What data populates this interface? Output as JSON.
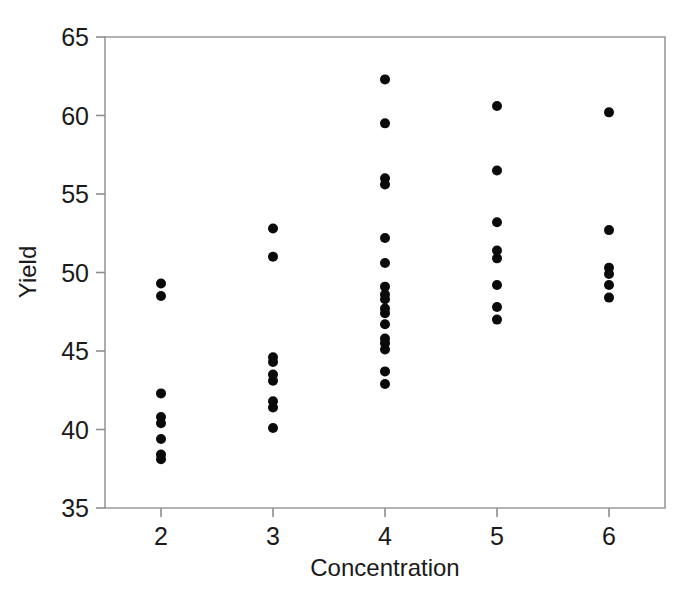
{
  "chart_data": {
    "type": "scatter",
    "title": "",
    "subtitle": "",
    "xlabel": "Concentration",
    "ylabel": "Yield",
    "xlim": [
      1.5,
      6.5
    ],
    "ylim": [
      35,
      65
    ],
    "xticks": [
      2,
      3,
      4,
      5,
      6
    ],
    "xtick_labels": [
      "2",
      "3",
      "4",
      "5",
      "6"
    ],
    "yticks": [
      35,
      40,
      45,
      50,
      55,
      60,
      65
    ],
    "ytick_labels": [
      "35",
      "40",
      "45",
      "50",
      "55",
      "60",
      "65"
    ],
    "grid": false,
    "legend": null,
    "legend_position": "none",
    "marker": {
      "shape": "circle",
      "color": "#0a0a0a",
      "size_px": 9
    },
    "series": [
      {
        "name": "Yield vs Concentration",
        "points": [
          {
            "x": 2,
            "y": 49.3
          },
          {
            "x": 2,
            "y": 48.5
          },
          {
            "x": 2,
            "y": 42.3
          },
          {
            "x": 2,
            "y": 40.8
          },
          {
            "x": 2,
            "y": 40.4
          },
          {
            "x": 2,
            "y": 39.4
          },
          {
            "x": 2,
            "y": 38.4
          },
          {
            "x": 2,
            "y": 38.1
          },
          {
            "x": 3,
            "y": 52.8
          },
          {
            "x": 3,
            "y": 51.0
          },
          {
            "x": 3,
            "y": 44.6
          },
          {
            "x": 3,
            "y": 44.3
          },
          {
            "x": 3,
            "y": 43.5
          },
          {
            "x": 3,
            "y": 43.1
          },
          {
            "x": 3,
            "y": 41.8
          },
          {
            "x": 3,
            "y": 41.4
          },
          {
            "x": 3,
            "y": 40.1
          },
          {
            "x": 4,
            "y": 62.3
          },
          {
            "x": 4,
            "y": 59.5
          },
          {
            "x": 4,
            "y": 56.0
          },
          {
            "x": 4,
            "y": 55.6
          },
          {
            "x": 4,
            "y": 52.2
          },
          {
            "x": 4,
            "y": 50.6
          },
          {
            "x": 4,
            "y": 49.1
          },
          {
            "x": 4,
            "y": 48.6
          },
          {
            "x": 4,
            "y": 48.3
          },
          {
            "x": 4,
            "y": 47.7
          },
          {
            "x": 4,
            "y": 47.4
          },
          {
            "x": 4,
            "y": 46.7
          },
          {
            "x": 4,
            "y": 45.8
          },
          {
            "x": 4,
            "y": 45.5
          },
          {
            "x": 4,
            "y": 45.1
          },
          {
            "x": 4,
            "y": 43.7
          },
          {
            "x": 4,
            "y": 42.9
          },
          {
            "x": 5,
            "y": 60.6
          },
          {
            "x": 5,
            "y": 56.5
          },
          {
            "x": 5,
            "y": 53.2
          },
          {
            "x": 5,
            "y": 51.4
          },
          {
            "x": 5,
            "y": 50.9
          },
          {
            "x": 5,
            "y": 49.2
          },
          {
            "x": 5,
            "y": 47.8
          },
          {
            "x": 5,
            "y": 47.0
          },
          {
            "x": 6,
            "y": 60.2
          },
          {
            "x": 6,
            "y": 52.7
          },
          {
            "x": 6,
            "y": 50.3
          },
          {
            "x": 6,
            "y": 49.9
          },
          {
            "x": 6,
            "y": 49.2
          },
          {
            "x": 6,
            "y": 48.4
          }
        ]
      }
    ]
  },
  "axes": {
    "y_title": "Yield",
    "x_title": "Concentration"
  },
  "colors": {
    "marker": "#0a0a0a",
    "frame": "#9a9a9a",
    "text": "#1a1a1a",
    "background": "#ffffff"
  }
}
